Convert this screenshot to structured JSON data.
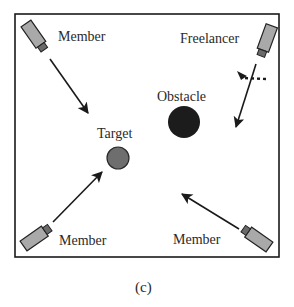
{
  "diagram": {
    "caption": "(c)",
    "colors": {
      "border": "#1a1a1a",
      "robot_body": "#a9a9a9",
      "robot_head": "#6a6a6a",
      "arrow": "#1a1a1a",
      "target": "#6e6e6e",
      "obstacle": "#1c1c1c"
    },
    "labels": {
      "member_top_left": "Member",
      "freelancer": "Freelancer",
      "obstacle": "Obstacle",
      "target": "Target",
      "member_bottom_left": "Member",
      "member_bottom_right": "Member"
    },
    "nodes": [
      {
        "id": "member-top-left",
        "type": "robot",
        "label": "Member"
      },
      {
        "id": "freelancer",
        "type": "robot",
        "label": "Freelancer"
      },
      {
        "id": "member-bottom-left",
        "type": "robot",
        "label": "Member"
      },
      {
        "id": "member-bottom-right",
        "type": "robot",
        "label": "Member"
      },
      {
        "id": "target",
        "type": "circle",
        "label": "Target"
      },
      {
        "id": "obstacle",
        "type": "circle",
        "label": "Obstacle"
      }
    ],
    "edges": [
      {
        "from": "member-top-left",
        "toward": "target"
      },
      {
        "from": "member-bottom-left",
        "toward": "target"
      },
      {
        "from": "member-bottom-right",
        "toward": "target"
      },
      {
        "from": "freelancer",
        "direction": "down-left",
        "alternate": "dotted-deflection"
      }
    ]
  }
}
